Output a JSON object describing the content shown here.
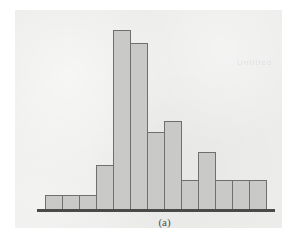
{
  "figure": {
    "caption": "(a)",
    "panel_color": "#ececeb",
    "bar_fill_color": "#c9c9c7",
    "bar_border_color": "#6f6f6f",
    "axis_color": "#4a4a4a",
    "background_color": "#ffffff"
  },
  "watermarks": {
    "right": "Untitled",
    "middle": ""
  },
  "chart_data": {
    "type": "bar",
    "title": "",
    "subtitle": "",
    "xlabel": "",
    "ylabel": "",
    "annotations": [
      "(a)"
    ],
    "legend": [],
    "legend_position": "none",
    "grid": false,
    "axis_visible": {
      "x": true,
      "y": false
    },
    "ylim": [
      0,
      100
    ],
    "xlim": [
      0,
      13
    ],
    "bin_count": 13,
    "categories": [
      "1",
      "2",
      "3",
      "4",
      "5",
      "6",
      "7",
      "8",
      "9",
      "10",
      "11",
      "12",
      "13"
    ],
    "tick_labels": {
      "x": [],
      "y": []
    },
    "values": [
      8,
      8,
      8,
      24,
      97,
      90,
      42,
      48,
      16,
      31,
      16,
      16,
      16
    ],
    "series": [
      {
        "name": "frequency",
        "values": [
          8,
          8,
          8,
          24,
          97,
          90,
          42,
          48,
          16,
          31,
          16,
          16,
          16
        ]
      }
    ]
  }
}
